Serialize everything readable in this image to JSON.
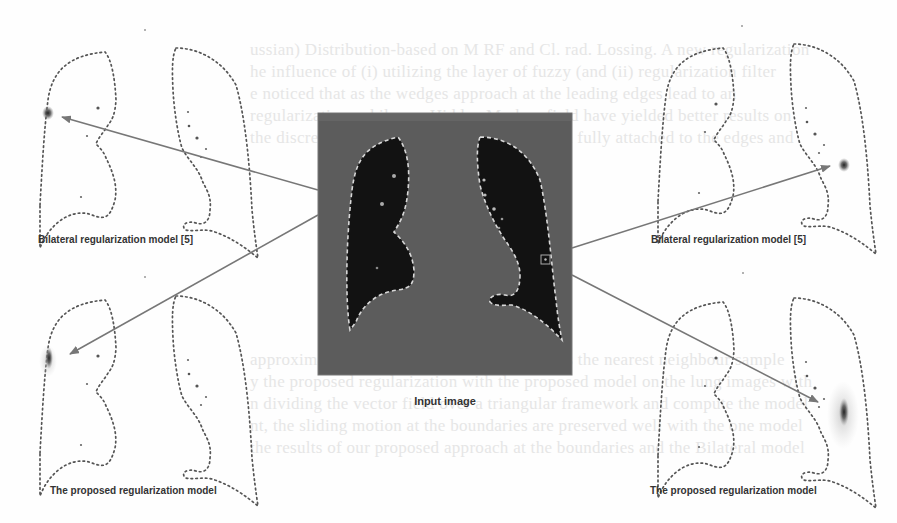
{
  "figure": {
    "center": {
      "caption": "Input image"
    },
    "panels": [
      {
        "id": "top-left",
        "caption": "Bilateral regularization model [5]"
      },
      {
        "id": "top-right",
        "caption": "Bilateral regularization model [5]"
      },
      {
        "id": "bottom-left",
        "caption": "The proposed regularization model"
      },
      {
        "id": "bottom-right",
        "caption": "The proposed regularization model"
      }
    ],
    "colors": {
      "contour": "#555555",
      "arrow": "#777777",
      "ct_background": "#5e5e5e",
      "lung_fill": "#121212",
      "segmentation_outline": "#d8d8d8"
    }
  },
  "background_text": {
    "lines": [
      "ussian) Distribution-based on M RF and Cl. rad. Lossing. A new regularization",
      "he influence of (i) utilizing the layer of fuzzy (and (ii) regularization filter",
      "e noticed that as the wedges approach at the leading edges lead to an",
      "regularization, while our Hidden Markov field have yielded better results on",
      "the discrepancy in the motion field have been fully attached to the edges and",
      "approximating the derivatives of the data was the nearest neighbour sample",
      "y the proposed regularization with the proposed model on the lung images with",
      "n dividing the vector field over a triangular framework and compute the model",
      "nt, the sliding motion at the boundaries are preserved well with the one model",
      "the results of our proposed approach at the boundaries and the Bilateral model"
    ]
  }
}
